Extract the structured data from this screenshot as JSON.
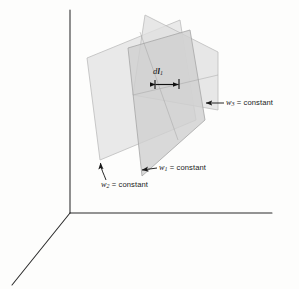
{
  "figure": {
    "background_color": "#fdfdfc",
    "axis_color": "#2b2b2b",
    "annotation_color": "#1a1a1a"
  },
  "axes": {
    "origin": {
      "x": 70,
      "y": 213
    },
    "vertical": {
      "x1": 70,
      "y1": 213,
      "x2": 70,
      "y2": 10,
      "name": "vertical-axis"
    },
    "horizontal": {
      "x1": 70,
      "y1": 213,
      "x2": 272,
      "y2": 213,
      "name": "horizontal-axis"
    },
    "diagonal": {
      "x1": 70,
      "y1": 213,
      "x2": 12,
      "y2": 285,
      "name": "diagonal-axis"
    }
  },
  "surfaces": [
    {
      "id": "w2-plane",
      "label_text": "constant",
      "variable": "w",
      "subscript": "2",
      "equals": "=",
      "fill": "#e2e2e2",
      "stroke": "#b0b0b0",
      "opacity": 0.72,
      "points": "87,58 180,20 196,120 100,160"
    },
    {
      "id": "w3-plane",
      "label_text": "constant",
      "variable": "w",
      "subscript": "3",
      "equals": "=",
      "fill": "#e6e6e6",
      "stroke": "#b4b4b4",
      "opacity": 0.72,
      "points": "145,15 218,52 218,110 133,95"
    },
    {
      "id": "w1-plane",
      "label_text": "constant",
      "variable": "w",
      "subscript": "1",
      "equals": "=",
      "fill": "#d2d2d2",
      "stroke": "#a8a8a8",
      "opacity": 0.78,
      "points": "128,48 190,30 205,120 142,176"
    }
  ],
  "labels": {
    "w3": {
      "variable": "w",
      "subscript": "3",
      "equals": "=",
      "value": "constant",
      "arrow": {
        "tail_x": 224,
        "tail_y": 103,
        "head_x": 205,
        "head_y": 103
      }
    },
    "w1": {
      "variable": "w",
      "subscript": "1",
      "equals": "=",
      "value": "constant",
      "arrow": {
        "tail_x": 157,
        "tail_y": 168,
        "head_x": 141,
        "head_y": 170
      }
    },
    "w2": {
      "variable": "w",
      "subscript": "2",
      "equals": "=",
      "value": "constant",
      "arrow": {
        "tail_x": 104,
        "tail_y": 180,
        "head_x": 100,
        "head_y": 160
      }
    },
    "dl1": {
      "variable": "d",
      "vector": "l",
      "subscript": "1",
      "caliper": {
        "left_x": 155,
        "right_x": 178,
        "y": 84
      }
    }
  }
}
